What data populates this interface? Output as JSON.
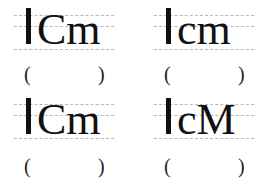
{
  "cells": [
    {
      "id": 1,
      "text": "Cm",
      "answer_open": "(",
      "answer_close": ")",
      "answer": ""
    },
    {
      "id": 2,
      "text": "cm",
      "answer_open": "(",
      "answer_close": ")",
      "answer": ""
    },
    {
      "id": 3,
      "text": "Cm",
      "answer_open": "(",
      "answer_close": ")",
      "answer": ""
    },
    {
      "id": 4,
      "text": "cM",
      "answer_open": "(",
      "answer_close": ")",
      "answer": ""
    }
  ],
  "colors": {
    "ink": "#111111",
    "guide_lines": "#b8b8b8"
  }
}
